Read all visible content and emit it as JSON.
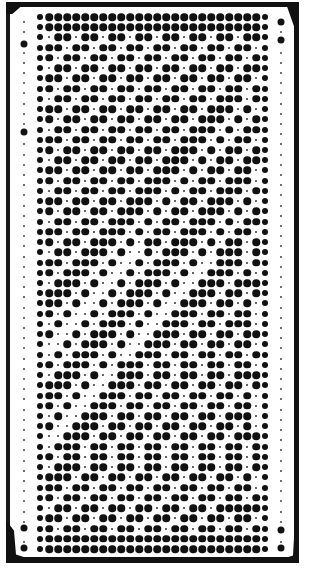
{
  "card": {
    "type": "knitting-machine-punch-card",
    "columns": 26,
    "rows_count": 53,
    "colors": {
      "hole": "#111111",
      "paper": "#ffffff",
      "border": "#111111"
    },
    "legend": {
      "B": "punched-hole",
      "s": "marker-dot"
    },
    "rows": [
      "BBBBBBBBBBBBBBBBBBBBBBBBBB",
      "BBBBBBBBBBBBBBBBBBBBBBBBBB",
      "BsBBsBBsBBsBBsBBsBBsBBsBBB",
      "BBBsBBsBBsBBsBBsBBsBBsBBsB",
      "BBsBBsBBsBBsBBsBBsBBsBBsBB",
      "BsBBsBBsBBsBBsBBsBBsBBsBBB",
      "BBBsBBsBBsBBsBBsBBsBBsBBsB",
      "BBsBBsBBsBBsBBsBBsBBsBBsBB",
      "BsBBsBBsBBsBBsBBsBBsBBBsBB",
      "BBBsBBsBBsBBsBBsBBsBBBsBsB",
      "BBsBBsBBsBBsBBsBBsBBBsBsBB",
      "BsBBsBBsBBsBBsBBsBBBsBsBBB",
      "BBBsBBsBBsBBsBBsBBBsBsBBsB",
      "BBsBBsBBsBBsBBsBBBsBsBBsBB",
      "BsBBsBBsBBsBBsBBBsBsBBsBBB",
      "BBBsBBsBBsBBsBBBsBsBBsBBsB",
      "BBsBBsBBsBBsBBBsBsBBsBBBsB",
      "BsBBsBBsBBsBBBsBsBBsBBBsBB",
      "BBBsBBsBBsBBBsBsBBsBBBsBsB",
      "BBsBBsBBsBBBsBsBBsBBBsBsBB",
      "BsBBsBBsBBBsBsBBsBBBsBsBBB",
      "BBBsBBsBBBsBsBBsBBBsBsBBsB",
      "BBsBBsBBBsBsBBsBBBsBsBBsBB",
      "BsBBsBBBsBssBsBBBsBsBBBsBB",
      "BBBsBBBsBssBsBBBsBssBBBsBB",
      "BBsBBBsBssBsBBBsBssBBBsBsB",
      "BsBBBsBssBsBBBsBssBBBsBBBB",
      "BBBBsBssBsBBBsBssBBBsBBsBB",
      "BBBsBssBsBBBsBssBBBsBBsBsB",
      "BBsBssBsBBBsBssBBBsBBsBBsB",
      "BsBssBsBBBsBssBBBsBBsBBBsB",
      "BBssBsBBBsBssBBBsBBsBBsBBB",
      "BssBsBBBsBssBBBsBBsBBsBBsB",
      "BsBsBBBsBssBBBsBBsBBsBBsBB",
      "BBsBBBsBsBBBsBBsBBsBBsBBsB",
      "BsBBBsBssBBBsBBsBBsBBsBBBB",
      "BBBBsBssBBBsBBsBBsBBsBBsBB",
      "BBBsBssBBBsBBsBBsBBsBBsBsB",
      "BBsBssBBBsBBsBBsBBsBBsBBsB",
      "BsBssBBBsBBsBBsBBsBBsBBBsB",
      "BBssBBBsBBsBBsBBsBBsBBsBsB",
      "BssBBBsBBsBBsBBsBBsBBsBBBB",
      "BsBBBsBBsBBsBBsBBsBBsBBsBB",
      "BBsBBsBBsBBsBBsBBsBBsBBsBB",
      "BsBBBsBBsBBsBBsBBsBBsBBsBB",
      "BBBBsBBsBBsBBsBBsBBsBBsBsB",
      "BBBsBBsBBsBBsBBsBBsBBsBBsB",
      "BBsBBsBBsBBsBBsBBsBBsBBsBB",
      "BsBBsBBsBBsBBsBBsBBsBBBBBB",
      "BBBsBBsBBsBBsBBsBBsBBsBBsB",
      "BBsBBsBBsBBsBBsBBsBBsBBsBB",
      "BBBBBBBBBBBBBBBBBBBBBBBBBB",
      "BBBBBBBBBBBBBBBBBBBBBBBBBB"
    ],
    "edge_holes": {
      "left_big_y": [
        44,
        132,
        528,
        548
      ],
      "right_big_y": [
        22,
        40,
        530,
        548
      ]
    }
  }
}
